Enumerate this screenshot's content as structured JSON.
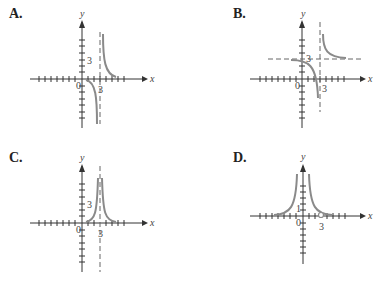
{
  "panels": [
    {
      "label": "A.",
      "x_axis": "x",
      "y_axis": "y",
      "origin": "0",
      "x_tick_label": "3",
      "y_tick_label": "3",
      "vertical_asymptote": "x = 3",
      "horizontal_asymptote": "y = 0"
    },
    {
      "label": "B.",
      "x_axis": "x",
      "y_axis": "y",
      "origin": "0",
      "x_tick_label": "3",
      "y_tick_label": "3",
      "vertical_asymptote": "x = 3",
      "horizontal_asymptote": "y = 3"
    },
    {
      "label": "C.",
      "x_axis": "x",
      "y_axis": "y",
      "origin": "0",
      "x_tick_label": "3",
      "y_tick_label": "3",
      "vertical_asymptote": "x = 3",
      "horizontal_asymptote": "y = 0"
    },
    {
      "label": "D.",
      "x_axis": "x",
      "y_axis": "y",
      "origin": "0",
      "x_tick_label": "3",
      "y_tick_label": "1",
      "vertical_asymptote": "x = 0",
      "horizontal_asymptote": "y = 0",
      "hole": "(3, 0)"
    }
  ],
  "colors": {
    "curve": "#8a8a8a",
    "axis": "#333333",
    "asymptote": "#666666"
  }
}
